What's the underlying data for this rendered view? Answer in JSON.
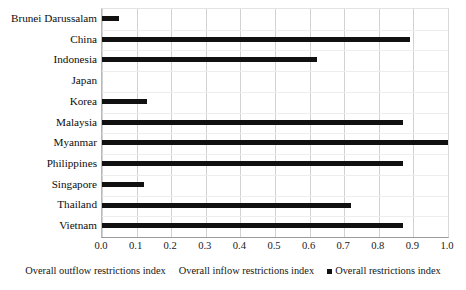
{
  "chart_data": {
    "type": "bar",
    "orientation": "horizontal",
    "title": "",
    "subtitle": "",
    "xlabel": "",
    "ylabel": "",
    "xlim": [
      0.0,
      1.0
    ],
    "grid": true,
    "legend_position": "bottom",
    "categories": [
      "Brunei Darussalam",
      "China",
      "Indonesia",
      "Japan",
      "Korea",
      "Malaysia",
      "Myanmar",
      "Philippines",
      "Singapore",
      "Thailand",
      "Vietnam"
    ],
    "tick_labels": [
      "0.0",
      "0.1",
      "0.2",
      "0.3",
      "0.4",
      "0.5",
      "0.6",
      "0.7",
      "0.8",
      "0.9",
      "1.0"
    ],
    "tick_values": [
      0.0,
      0.1,
      0.2,
      0.3,
      0.4,
      0.5,
      0.6,
      0.7,
      0.8,
      0.9,
      1.0
    ],
    "series": [
      {
        "name": "Overall restrictions index",
        "color": "#111111",
        "values": [
          0.05,
          0.89,
          0.62,
          0.0,
          0.13,
          0.87,
          1.0,
          0.87,
          0.12,
          0.72,
          0.87
        ]
      }
    ],
    "legend": [
      {
        "label": "Overall outflow restrictions index",
        "marker": "none",
        "color": "#111111"
      },
      {
        "label": "Overall inflow restrictions index",
        "marker": "none",
        "color": "#111111"
      },
      {
        "label": "Overall restrictions index",
        "marker": "square",
        "color": "#111111"
      }
    ]
  }
}
